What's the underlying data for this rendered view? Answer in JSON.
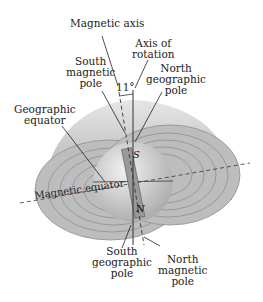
{
  "figure": {
    "labels": {
      "magnetic_axis": "Magnetic axis",
      "axis_of_rotation_1": "Axis of",
      "axis_of_rotation_2": "rotation",
      "south_magnetic_pole_1": "South",
      "south_magnetic_pole_2": "magnetic",
      "south_magnetic_pole_3": "pole",
      "north_geographic_pole_1": "North",
      "north_geographic_pole_2": "geographic",
      "north_geographic_pole_3": "pole",
      "geographic_equator_1": "Geographic",
      "geographic_equator_2": "equator",
      "magnetic_equator": "Magnetic equator",
      "south_geographic_pole_1": "South",
      "south_geographic_pole_2": "geographic",
      "south_geographic_pole_3": "pole",
      "north_magnetic_pole_1": "North",
      "north_magnetic_pole_2": "magnetic",
      "north_magnetic_pole_3": "pole",
      "angle": "11°",
      "bar_s": "S",
      "bar_n": "N"
    },
    "colors": {
      "field": "#b5b5b5",
      "sphere": "#d0d0d0",
      "line": "#333333"
    }
  }
}
